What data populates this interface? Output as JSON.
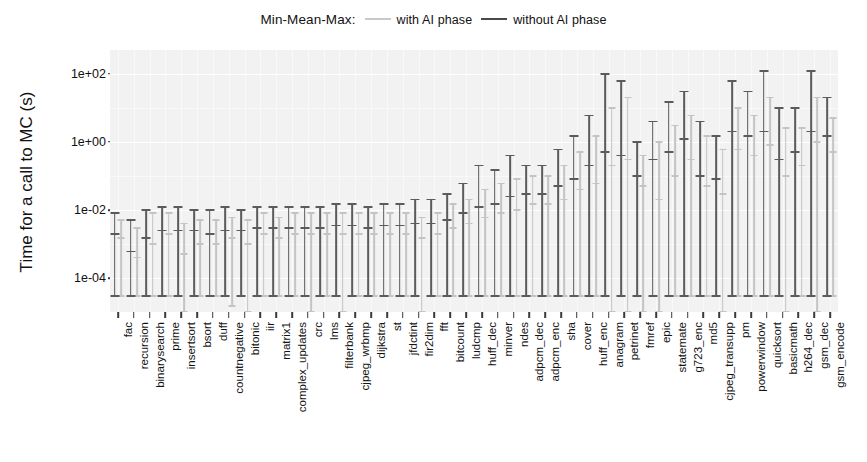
{
  "legend": {
    "title": "Min-Mean-Max:",
    "entries": [
      {
        "label": "with AI phase",
        "color": "#c4c4c4",
        "key": "with_ai"
      },
      {
        "label": "without AI phase",
        "color": "#5b5b5b",
        "key": "without_ai"
      }
    ]
  },
  "axes": {
    "ylabel": "Time for a call to MC (s)",
    "xlabel": "",
    "yticklabels": [
      "1e+02",
      "1e+00",
      "1e-02",
      "1e-04"
    ],
    "ytickvalues": [
      100,
      1,
      0.01,
      0.0001
    ],
    "ylim": [
      1e-05,
      500
    ],
    "yscale": "log",
    "grid": true,
    "panel_background": "#f2f2f2",
    "grid_color": "#ffffff"
  },
  "chart_data": {
    "type": "bar",
    "title": "",
    "subtitle": "",
    "xlabel": "",
    "ylabel": "Time for a call to MC (s)",
    "ylim": [
      1e-05,
      500
    ],
    "yscale": "log",
    "grid": true,
    "legend_position": "top",
    "value_kind": "min-mean-max error bars",
    "categories": [
      "fac",
      "recursion",
      "binarysearch",
      "prime",
      "insertsort",
      "bsort",
      "duff",
      "countnegative",
      "bitonic",
      "iir",
      "matrix1",
      "complex_updates",
      "crc",
      "lms",
      "filterbank",
      "cjpeg_wrbmp",
      "dijkstra",
      "st",
      "jfdctint",
      "fir2dim",
      "fft",
      "bitcount",
      "ludcmp",
      "huff_dec",
      "minver",
      "ndes",
      "adpcm_dec",
      "adpcm_enc",
      "sha",
      "cover",
      "huff_enc",
      "anagram",
      "petrinet",
      "fmref",
      "epic",
      "statemate",
      "g723_enc",
      "md5",
      "cjpeg_transupp",
      "pm",
      "powerwindow",
      "quicksort",
      "basicmath",
      "h264_dec",
      "gsm_dec",
      "gsm_encode"
    ],
    "series": [
      {
        "name": "without AI phase",
        "color": "#5b5b5b",
        "min": [
          3e-05,
          3e-05,
          3e-05,
          3e-05,
          3e-05,
          3e-05,
          3e-05,
          3e-05,
          3e-05,
          3e-05,
          3e-05,
          3e-05,
          3e-05,
          3e-05,
          3e-05,
          3e-05,
          3e-05,
          3e-05,
          3e-05,
          3e-05,
          3e-05,
          3e-05,
          3e-05,
          3e-05,
          3e-05,
          3e-05,
          3e-05,
          3e-05,
          3e-05,
          3e-05,
          3e-05,
          3e-05,
          3e-05,
          3e-05,
          3e-05,
          3e-05,
          3e-05,
          3e-05,
          3e-05,
          3e-05,
          3e-05,
          3e-05,
          3e-05,
          3e-05,
          3e-05,
          3e-05
        ],
        "mean": [
          0.002,
          0.0006,
          0.0015,
          0.0025,
          0.0025,
          0.0025,
          0.002,
          0.0025,
          0.0025,
          0.003,
          0.003,
          0.003,
          0.003,
          0.003,
          0.0035,
          0.0035,
          0.003,
          0.0035,
          0.0035,
          0.004,
          0.004,
          0.005,
          0.008,
          0.012,
          0.015,
          0.025,
          0.03,
          0.03,
          0.05,
          0.08,
          0.2,
          0.5,
          0.4,
          0.1,
          0.3,
          0.5,
          1.2,
          0.1,
          0.08,
          2.0,
          1.5,
          2.0,
          0.3,
          0.5,
          2.0,
          1.5
        ],
        "max": [
          0.008,
          0.005,
          0.01,
          0.012,
          0.012,
          0.01,
          0.01,
          0.012,
          0.01,
          0.012,
          0.012,
          0.012,
          0.012,
          0.012,
          0.015,
          0.015,
          0.012,
          0.015,
          0.015,
          0.02,
          0.02,
          0.03,
          0.06,
          0.2,
          0.15,
          0.4,
          0.2,
          0.2,
          0.6,
          1.5,
          6.0,
          100.0,
          60.0,
          1.0,
          4.0,
          15.0,
          30.0,
          4.0,
          1.5,
          60.0,
          30.0,
          120.0,
          10.0,
          10.0,
          120.0,
          20.0
        ]
      },
      {
        "name": "with AI phase",
        "color": "#c4c4c4",
        "min": [
          3e-05,
          3e-05,
          3e-05,
          3e-05,
          1e-05,
          3e-05,
          3e-05,
          1.5e-05,
          1e-05,
          3e-05,
          3e-05,
          3e-05,
          1e-05,
          3e-05,
          1e-05,
          3e-05,
          3e-05,
          3e-05,
          3e-05,
          1e-05,
          3e-05,
          3e-05,
          3e-05,
          3e-05,
          3e-05,
          3e-05,
          3e-05,
          3e-05,
          3e-05,
          3e-05,
          3e-05,
          1e-05,
          1e-05,
          1e-05,
          1e-05,
          3e-05,
          3e-05,
          3e-05,
          1e-05,
          3e-05,
          3e-05,
          3e-05,
          1e-05,
          3e-05,
          1e-05,
          3e-05
        ],
        "mean": [
          0.0015,
          0.0004,
          0.001,
          0.002,
          0.0005,
          0.001,
          0.001,
          0.0015,
          0.001,
          0.002,
          0.0015,
          0.002,
          0.002,
          0.002,
          0.002,
          0.002,
          0.002,
          0.002,
          0.002,
          0.0015,
          0.002,
          0.003,
          0.004,
          0.006,
          0.008,
          0.01,
          0.015,
          0.015,
          0.02,
          0.04,
          0.06,
          0.2,
          0.3,
          0.05,
          0.02,
          0.1,
          0.3,
          0.05,
          0.03,
          0.6,
          0.4,
          0.8,
          0.1,
          0.2,
          1.0,
          0.5
        ],
        "max": [
          0.005,
          0.003,
          0.008,
          0.008,
          0.004,
          0.005,
          0.005,
          0.006,
          0.005,
          0.008,
          0.006,
          0.008,
          0.008,
          0.008,
          0.008,
          0.008,
          0.008,
          0.008,
          0.008,
          0.006,
          0.008,
          0.015,
          0.02,
          0.04,
          0.06,
          0.08,
          0.1,
          0.1,
          0.2,
          0.5,
          1.5,
          10.0,
          20.0,
          0.4,
          1.0,
          3.0,
          6.0,
          1.5,
          0.6,
          10.0,
          6.0,
          20.0,
          2.5,
          2.5,
          20.0,
          5.0
        ]
      }
    ]
  }
}
